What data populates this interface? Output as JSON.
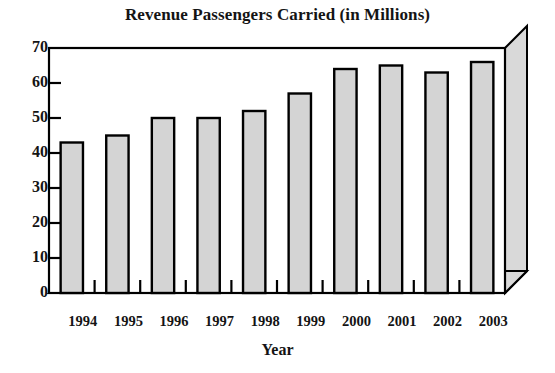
{
  "chart_data": {
    "type": "bar",
    "title": "Revenue Passengers Carried (in Millions)",
    "xlabel": "Year",
    "ylabel": "",
    "categories": [
      "1994",
      "1995",
      "1996",
      "1997",
      "1998",
      "1999",
      "2000",
      "2001",
      "2002",
      "2003"
    ],
    "values": [
      43,
      45,
      50,
      50,
      52,
      57,
      64,
      65,
      63,
      66
    ],
    "ylim": [
      0,
      70
    ],
    "ytick_step": 10,
    "yticks": [
      "0",
      "10",
      "20",
      "30",
      "40",
      "50",
      "60",
      "70"
    ],
    "grid": false,
    "legend": null,
    "style": {
      "bar_fill": "#d4d4d4",
      "bar_border": "#000000",
      "panel_fill": "#ffffff",
      "depth_fill": "#d9d9d9",
      "axis_color": "#000000"
    }
  },
  "axis": {
    "x_title": "Year"
  }
}
